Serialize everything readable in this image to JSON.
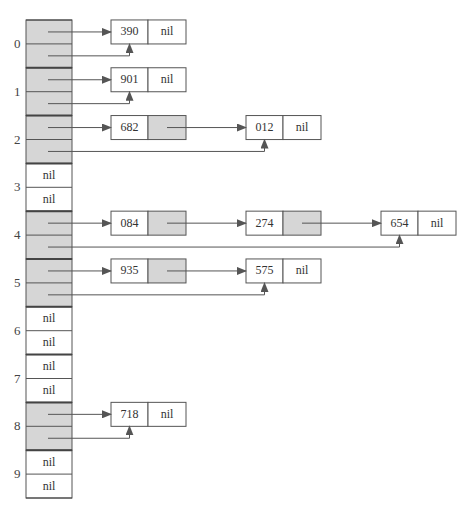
{
  "diagram": {
    "type": "hash-table-chaining",
    "colors": {
      "line": "#555555",
      "fill": "#d6d6d6",
      "divider": "#444444",
      "bg": "#ffffff"
    },
    "nil_label": "nil",
    "buckets": [
      {
        "index": "0",
        "label": "0",
        "chain": [
          "390"
        ]
      },
      {
        "index": "1",
        "label": "1",
        "chain": [
          "901"
        ]
      },
      {
        "index": "2",
        "label": "2",
        "chain": [
          "682",
          "012"
        ]
      },
      {
        "index": "3",
        "label": "3",
        "chain": []
      },
      {
        "index": "4",
        "label": "4",
        "chain": [
          "084",
          "274",
          "654"
        ]
      },
      {
        "index": "5",
        "label": "5",
        "chain": [
          "935",
          "575"
        ]
      },
      {
        "index": "6",
        "label": "6",
        "chain": []
      },
      {
        "index": "7",
        "label": "7",
        "chain": []
      },
      {
        "index": "8",
        "label": "8",
        "chain": [
          "718"
        ]
      },
      {
        "index": "9",
        "label": "9",
        "chain": []
      }
    ]
  }
}
